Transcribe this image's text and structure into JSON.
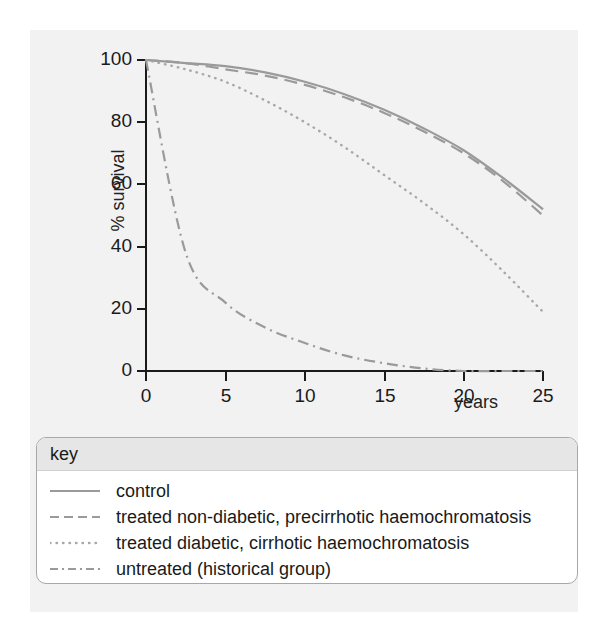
{
  "chart_data": {
    "type": "line",
    "title": "",
    "xlabel": "years",
    "ylabel": "% survival",
    "xlim": [
      0,
      25
    ],
    "ylim": [
      0,
      100
    ],
    "xticks": [
      "0",
      "5",
      "10",
      "15",
      "20",
      "25"
    ],
    "yticks": [
      "0",
      "20",
      "40",
      "60",
      "80",
      "100"
    ],
    "grid": false,
    "legend_position": "below-plot",
    "legend_title": "key",
    "x": [
      0,
      2.5,
      5,
      7.5,
      10,
      12.5,
      15,
      17.5,
      20,
      22.5,
      25
    ],
    "series": [
      {
        "name": "control",
        "style": "solid",
        "color": "#9a9a9a",
        "values": [
          100,
          99,
          98,
          96,
          93,
          89,
          84,
          78,
          71,
          62,
          52
        ]
      },
      {
        "name": "treated non-diabetic, precirrhotic haemochromatosis",
        "style": "dashed",
        "color": "#9a9a9a",
        "values": [
          100,
          99,
          97,
          95,
          92,
          88,
          83,
          77,
          70,
          61,
          50
        ]
      },
      {
        "name": "treated diabetic, cirrhotic haemochromatosis",
        "style": "dotted",
        "color": "#a8a8a8",
        "values": [
          100,
          97,
          93,
          87,
          80,
          72,
          63,
          54,
          44,
          32,
          19
        ]
      },
      {
        "name": "untreated (historical group)",
        "style": "dash-dot",
        "color": "#9a9a9a",
        "values": [
          100,
          38,
          22,
          14,
          9,
          5,
          2.5,
          0.8,
          0,
          0,
          0
        ]
      }
    ]
  },
  "axes": {
    "ylabel": "% survival",
    "xlabel": "years",
    "yticks": [
      {
        "label": "100"
      },
      {
        "label": "80"
      },
      {
        "label": "60"
      },
      {
        "label": "40"
      },
      {
        "label": "20"
      },
      {
        "label": "0"
      }
    ],
    "xticks": [
      {
        "label": "0"
      },
      {
        "label": "5"
      },
      {
        "label": "10"
      },
      {
        "label": "15"
      },
      {
        "label": "20"
      },
      {
        "label": "25"
      }
    ]
  },
  "legend": {
    "title": "key",
    "items": [
      {
        "label": "control",
        "style": "solid"
      },
      {
        "label": "treated non-diabetic, precirrhotic haemochromatosis",
        "style": "dashed"
      },
      {
        "label": "treated diabetic, cirrhotic haemochromatosis",
        "style": "dotted"
      },
      {
        "label": "untreated (historical group)",
        "style": "dash-dot"
      }
    ]
  },
  "colors": {
    "line": "#9a9a9a",
    "dotted_line": "#a8a8a8",
    "axis": "#1a1a1a",
    "panel_background": "#f2f2f2",
    "legend_header": "#e6e6e6",
    "legend_border": "#a8a8a8"
  }
}
